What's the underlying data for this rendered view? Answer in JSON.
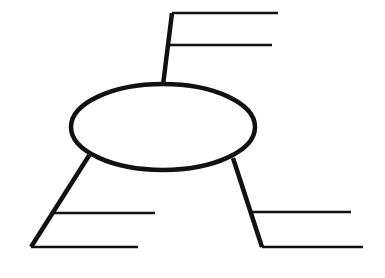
{
  "diagram": {
    "title": "Blank concept map graphic organizer",
    "type": "concept-map",
    "background_color": "#ffffff",
    "ink_color": "#111111",
    "canvas": {
      "width": 385,
      "height": 278
    },
    "center_node": {
      "name": "central-idea-ellipse",
      "shape": "ellipse",
      "label": "",
      "cx": 163,
      "cy": 127,
      "rx": 92,
      "ry": 43,
      "stroke_width": 4.5
    },
    "branches": [
      {
        "id": "branch-top",
        "name": "branch-top",
        "label": "",
        "direction": "up-right",
        "connector_stroke_width": 4.5,
        "connector_points": "163,85 172,13",
        "elbow_x": 172,
        "elbow_y": 13,
        "lines": [
          {
            "id": "top-line-1",
            "name": "writing-line-top-1",
            "text": "",
            "x1": 172,
            "y1": 13,
            "x2": 278,
            "y2": 13,
            "stroke_width": 2.6
          },
          {
            "id": "top-line-2",
            "name": "writing-line-top-2",
            "text": "",
            "x1": 169,
            "y1": 45,
            "x2": 272,
            "y2": 45,
            "stroke_width": 2.6
          }
        ]
      },
      {
        "id": "branch-lower-left",
        "name": "branch-lower-left",
        "label": "",
        "direction": "down-left",
        "connector_stroke_width": 4.5,
        "connector_points": "90,154 31,247",
        "elbow_x": 31,
        "elbow_y": 247,
        "lines": [
          {
            "id": "left-line-1",
            "name": "writing-line-left-1",
            "text": "",
            "x1": 52,
            "y1": 213,
            "x2": 155,
            "y2": 213,
            "stroke_width": 2.6
          },
          {
            "id": "left-line-2",
            "name": "writing-line-left-2",
            "text": "",
            "x1": 31,
            "y1": 247,
            "x2": 138,
            "y2": 247,
            "stroke_width": 2.6
          }
        ]
      },
      {
        "id": "branch-lower-right",
        "name": "branch-lower-right",
        "label": "",
        "direction": "down-right",
        "connector_stroke_width": 4.5,
        "connector_points": "233,158 262,247",
        "elbow_x": 262,
        "elbow_y": 247,
        "lines": [
          {
            "id": "right-line-1",
            "name": "writing-line-right-1",
            "text": "",
            "x1": 252,
            "y1": 212,
            "x2": 351,
            "y2": 212,
            "stroke_width": 2.6
          },
          {
            "id": "right-line-2",
            "name": "writing-line-right-2",
            "text": "",
            "x1": 262,
            "y1": 247,
            "x2": 363,
            "y2": 247,
            "stroke_width": 2.6
          }
        ]
      }
    ]
  }
}
